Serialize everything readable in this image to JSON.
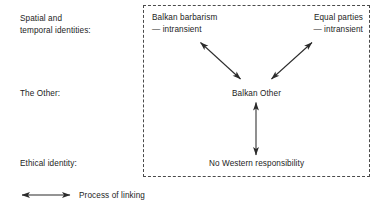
{
  "figure": {
    "background_color": "#ffffff",
    "line_color": "#2b2b2b",
    "dashed_border_color": "#4a4a4a",
    "text_color": "#1c1c1c"
  },
  "row_labels": [
    {
      "id": "spatial-temporal-identities",
      "text": "Spatial and\ntemporal identities:"
    },
    {
      "id": "the-other",
      "text": "The Other:"
    },
    {
      "id": "ethical-identity",
      "text": "Ethical identity:"
    }
  ],
  "nodes": [
    {
      "id": "balkan-barbarism",
      "text": "Balkan barbarism\n— intransient",
      "align": "left"
    },
    {
      "id": "equal-parties",
      "text": "Equal parties\n— intransient",
      "align": "right"
    },
    {
      "id": "balkan-other",
      "text": "Balkan Other",
      "align": "center"
    },
    {
      "id": "no-western-responsibility",
      "text": "No Western responsibility",
      "align": "center"
    }
  ],
  "connections": [
    {
      "id": "balkan-other-to-balkan-barbarism",
      "style": "double-headed-arrow"
    },
    {
      "id": "balkan-other-to-equal-parties",
      "style": "double-headed-arrow"
    },
    {
      "id": "balkan-other-to-no-western-responsibility",
      "style": "double-headed-arrow"
    }
  ],
  "legend": {
    "symbol": "double-headed-arrow",
    "label": "Process of linking"
  }
}
